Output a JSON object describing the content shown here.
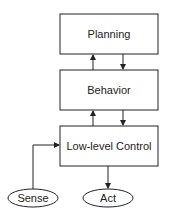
{
  "diagram": {
    "nodes": {
      "planning": {
        "label": "Planning",
        "shape": "rect"
      },
      "behavior": {
        "label": "Behavior",
        "shape": "rect"
      },
      "low_level_control": {
        "label": "Low-level Control",
        "shape": "rect"
      },
      "sense": {
        "label": "Sense",
        "shape": "ellipse"
      },
      "act": {
        "label": "Act",
        "shape": "ellipse"
      }
    },
    "edges": [
      {
        "from": "behavior",
        "to": "planning"
      },
      {
        "from": "planning",
        "to": "behavior"
      },
      {
        "from": "low_level_control",
        "to": "behavior"
      },
      {
        "from": "behavior",
        "to": "low_level_control"
      },
      {
        "from": "sense",
        "to": "low_level_control"
      },
      {
        "from": "low_level_control",
        "to": "act"
      }
    ],
    "colors": {
      "stroke": "#222222",
      "background": "#ffffff"
    }
  }
}
